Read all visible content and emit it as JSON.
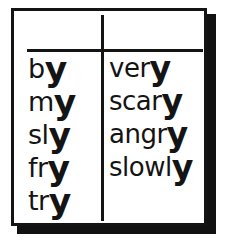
{
  "page": {
    "background_color": "#ffffff",
    "ink_color": "#141414"
  },
  "frame": {
    "border_color": "#141414",
    "shadow_color": "#111111",
    "divider_style": "cross-rule"
  },
  "columns": [
    {
      "name": "left-column",
      "words": [
        {
          "stem": "b",
          "ending": "y",
          "full": "by"
        },
        {
          "stem": "m",
          "ending": "y",
          "full": "my"
        },
        {
          "stem": "sl",
          "ending": "y",
          "full": "sly"
        },
        {
          "stem": "fr",
          "ending": "y",
          "full": "fry"
        },
        {
          "stem": "tr",
          "ending": "y",
          "full": "try"
        }
      ]
    },
    {
      "name": "right-column",
      "words": [
        {
          "stem": "ver",
          "ending": "y",
          "full": "very"
        },
        {
          "stem": "scar",
          "ending": "y",
          "full": "scary"
        },
        {
          "stem": "angr",
          "ending": "y",
          "full": "angry"
        },
        {
          "stem": "slowl",
          "ending": "y",
          "full": "slowly"
        }
      ]
    }
  ]
}
